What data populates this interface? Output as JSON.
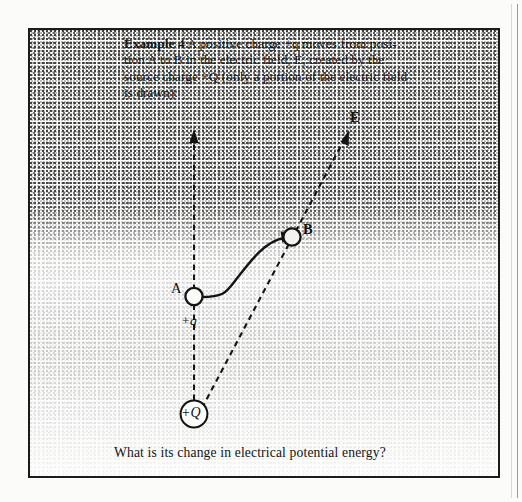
{
  "figure": {
    "problem": {
      "lead_label": "Example 4",
      "lines": [
        "Example 4  A positive charge +q moves from posi-",
        "tion A to B in the electric field, E, created by the",
        "source charge +Q (only a portion of the electric field",
        "is drawn):"
      ],
      "line1_after_lead": "  A positive charge +q moves from posi-",
      "line2": "tion A to B in the electric field, E, created by the",
      "line3": "source charge +Q (only a portion of the electric field",
      "line4": "is drawn):",
      "full_text": "Example 4  A positive charge +q moves from position A to B in the electric field, E, created by the source charge +Q (only a portion of the electric field is drawn):"
    },
    "question": "What is its change in electrical potential energy?",
    "labels": {
      "point_a": "A",
      "point_b": "B",
      "field": "E",
      "test_charge": "+q",
      "source_charge": "+Q"
    },
    "colors": {
      "ink": "#141414",
      "frame": "#1b1b1b",
      "paper": "#fdfdfc"
    }
  }
}
